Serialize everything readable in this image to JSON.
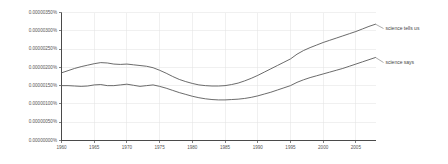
{
  "chart_data": {
    "type": "line",
    "title": "",
    "subtitle": "",
    "xlabel": "",
    "ylabel": "",
    "xlim": [
      1960,
      2008
    ],
    "ylim": [
      0.0,
      3.5e-06
    ],
    "grid": true,
    "legend_position": "right-inline-labels",
    "x_tick_labels": [
      "1960",
      "1965",
      "1970",
      "1975",
      "1980",
      "1985",
      "1990",
      "1995",
      "2000",
      "2005"
    ],
    "x_tick_values": [
      1960,
      1965,
      1970,
      1975,
      1980,
      1985,
      1990,
      1995,
      2000,
      2005
    ],
    "y_tick_labels": [
      "0.00000000%",
      "0.00000050%",
      "0.00000100%",
      "0.00000150%",
      "0.00000200%",
      "0.00000250%",
      "0.00000300%",
      "0.00000350%"
    ],
    "y_tick_values": [
      0.0,
      5e-07,
      1e-06,
      1.5e-06,
      2e-06,
      2.5e-06,
      3e-06,
      3.5e-06
    ],
    "x": [
      1960,
      1961,
      1962,
      1963,
      1964,
      1965,
      1966,
      1967,
      1968,
      1969,
      1970,
      1971,
      1972,
      1973,
      1974,
      1975,
      1976,
      1977,
      1978,
      1979,
      1980,
      1981,
      1982,
      1983,
      1984,
      1985,
      1986,
      1987,
      1988,
      1989,
      1990,
      1991,
      1992,
      1993,
      1994,
      1995,
      1996,
      1997,
      1998,
      1999,
      2000,
      2001,
      2002,
      2003,
      2004,
      2005,
      2006,
      2007,
      2008
    ],
    "series": [
      {
        "name": "science tells us",
        "color": "#5a5a5a",
        "label_at_x": 2008,
        "values": [
          1.85e-06,
          1.91e-06,
          1.97e-06,
          2.02e-06,
          2.06e-06,
          2.1e-06,
          2.13e-06,
          2.12e-06,
          2.09e-06,
          2.08e-06,
          2.09e-06,
          2.07e-06,
          2.05e-06,
          2.03e-06,
          1.99e-06,
          1.92e-06,
          1.84e-06,
          1.75e-06,
          1.67e-06,
          1.61e-06,
          1.56e-06,
          1.52e-06,
          1.5e-06,
          1.49e-06,
          1.49e-06,
          1.5e-06,
          1.53e-06,
          1.57e-06,
          1.63e-06,
          1.7e-06,
          1.78e-06,
          1.87e-06,
          1.96e-06,
          2.05e-06,
          2.14e-06,
          2.23e-06,
          2.36e-06,
          2.46e-06,
          2.54e-06,
          2.61e-06,
          2.68e-06,
          2.74e-06,
          2.8e-06,
          2.86e-06,
          2.92e-06,
          2.98e-06,
          3.05e-06,
          3.12e-06,
          3.18e-06
        ]
      },
      {
        "name": "science says",
        "color": "#5a5a5a",
        "label_at_x": 2008,
        "values": [
          1.5e-06,
          1.5e-06,
          1.49e-06,
          1.48e-06,
          1.49e-06,
          1.52e-06,
          1.53e-06,
          1.5e-06,
          1.5e-06,
          1.52e-06,
          1.54e-06,
          1.51e-06,
          1.48e-06,
          1.5e-06,
          1.52e-06,
          1.48e-06,
          1.43e-06,
          1.37e-06,
          1.31e-06,
          1.26e-06,
          1.21e-06,
          1.17e-06,
          1.14e-06,
          1.12e-06,
          1.11e-06,
          1.11e-06,
          1.12e-06,
          1.13e-06,
          1.15e-06,
          1.18e-06,
          1.22e-06,
          1.27e-06,
          1.32e-06,
          1.38e-06,
          1.44e-06,
          1.5e-06,
          1.59e-06,
          1.66e-06,
          1.72e-06,
          1.77e-06,
          1.82e-06,
          1.87e-06,
          1.92e-06,
          1.97e-06,
          2.03e-06,
          2.09e-06,
          2.15e-06,
          2.21e-06,
          2.27e-06
        ]
      }
    ]
  }
}
